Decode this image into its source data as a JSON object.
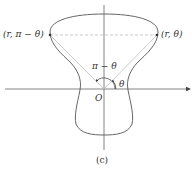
{
  "diagram": {
    "caption": "(c)",
    "origin_label": "O",
    "point_right_label": "(r, θ)",
    "point_left_label": "(r, π − θ)",
    "angle_theta_label": "θ",
    "angle_supplement_label": "π − θ"
  },
  "colors": {
    "curve": "#555555",
    "axes": "#666666",
    "rays": "#bbbbbb",
    "dashed": "#bbbbbb",
    "points": "#333333"
  }
}
